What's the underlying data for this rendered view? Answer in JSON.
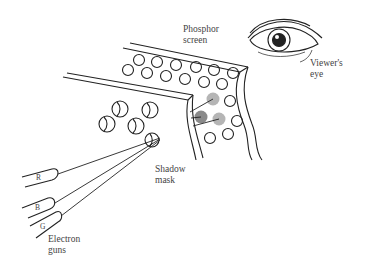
{
  "figure": {
    "labels": {
      "phosphor_screen": "Phosphor\nscreen",
      "viewers_eye": "Viewer's\neye",
      "shadow_mask": "Shadow\nmask",
      "electron_guns": "Electron\nguns"
    },
    "guns": [
      {
        "id": "R",
        "label": "R"
      },
      {
        "id": "B",
        "label": "B"
      },
      {
        "id": "G",
        "label": "G"
      }
    ],
    "colors": {
      "line": "#222222",
      "text": "#444444",
      "phosphor_lit_dark": "#8a8a8a",
      "phosphor_lit_light": "#b5b5b5",
      "background": "#ffffff"
    }
  }
}
